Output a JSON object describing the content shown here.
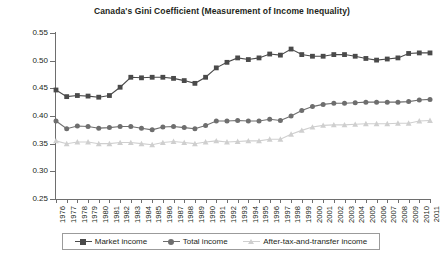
{
  "chart_data": {
    "type": "line",
    "title": "Canada's Gini Coefficient (Measurement of Income Inequality)",
    "xlabel": "",
    "ylabel": "",
    "ylim": [
      0.25,
      0.55
    ],
    "ytick_step": 0.05,
    "ytick_labels": [
      "0.55",
      "0.50",
      "0.45",
      "0.40",
      "0.35",
      "0.30",
      "0.25"
    ],
    "grid": false,
    "legend_position": "bottom",
    "categories": [
      "1976",
      "1977",
      "1978",
      "1979",
      "1980",
      "1981",
      "1982",
      "1983",
      "1984",
      "1985",
      "1986",
      "1987",
      "1988",
      "1989",
      "1990",
      "1991",
      "1992",
      "1993",
      "1994",
      "1995",
      "1996",
      "1997",
      "1998",
      "1999",
      "2000",
      "2001",
      "2002",
      "2003",
      "2004",
      "2005",
      "2006",
      "2007",
      "2008",
      "2009",
      "2010",
      "2011"
    ],
    "series": [
      {
        "name": "Market income",
        "marker": "square",
        "color": "#4a4a4a",
        "values": [
          0.447,
          0.435,
          0.437,
          0.436,
          0.434,
          0.437,
          0.452,
          0.47,
          0.469,
          0.47,
          0.47,
          0.468,
          0.464,
          0.459,
          0.47,
          0.487,
          0.497,
          0.505,
          0.502,
          0.505,
          0.512,
          0.51,
          0.521,
          0.511,
          0.508,
          0.508,
          0.511,
          0.511,
          0.508,
          0.504,
          0.501,
          0.503,
          0.505,
          0.513,
          0.514,
          0.514
        ]
      },
      {
        "name": "Total income",
        "marker": "circle",
        "color": "#6e6e6e",
        "values": [
          0.391,
          0.377,
          0.382,
          0.381,
          0.378,
          0.379,
          0.381,
          0.381,
          0.378,
          0.375,
          0.38,
          0.381,
          0.379,
          0.377,
          0.383,
          0.391,
          0.391,
          0.392,
          0.391,
          0.391,
          0.394,
          0.392,
          0.4,
          0.41,
          0.417,
          0.421,
          0.423,
          0.423,
          0.424,
          0.425,
          0.425,
          0.425,
          0.425,
          0.426,
          0.429,
          0.43
        ]
      },
      {
        "name": "After-tax-and-transfer income",
        "marker": "triangle",
        "color": "#cfcfcf",
        "values": [
          0.355,
          0.35,
          0.353,
          0.353,
          0.35,
          0.35,
          0.352,
          0.352,
          0.35,
          0.348,
          0.352,
          0.354,
          0.352,
          0.35,
          0.353,
          0.355,
          0.353,
          0.354,
          0.355,
          0.355,
          0.358,
          0.358,
          0.367,
          0.374,
          0.38,
          0.383,
          0.384,
          0.384,
          0.385,
          0.386,
          0.386,
          0.386,
          0.387,
          0.387,
          0.391,
          0.392
        ]
      }
    ]
  },
  "legend": {
    "items": [
      {
        "label": "Market income"
      },
      {
        "label": "Total income"
      },
      {
        "label": "After-tax-and-transfer income"
      }
    ]
  }
}
